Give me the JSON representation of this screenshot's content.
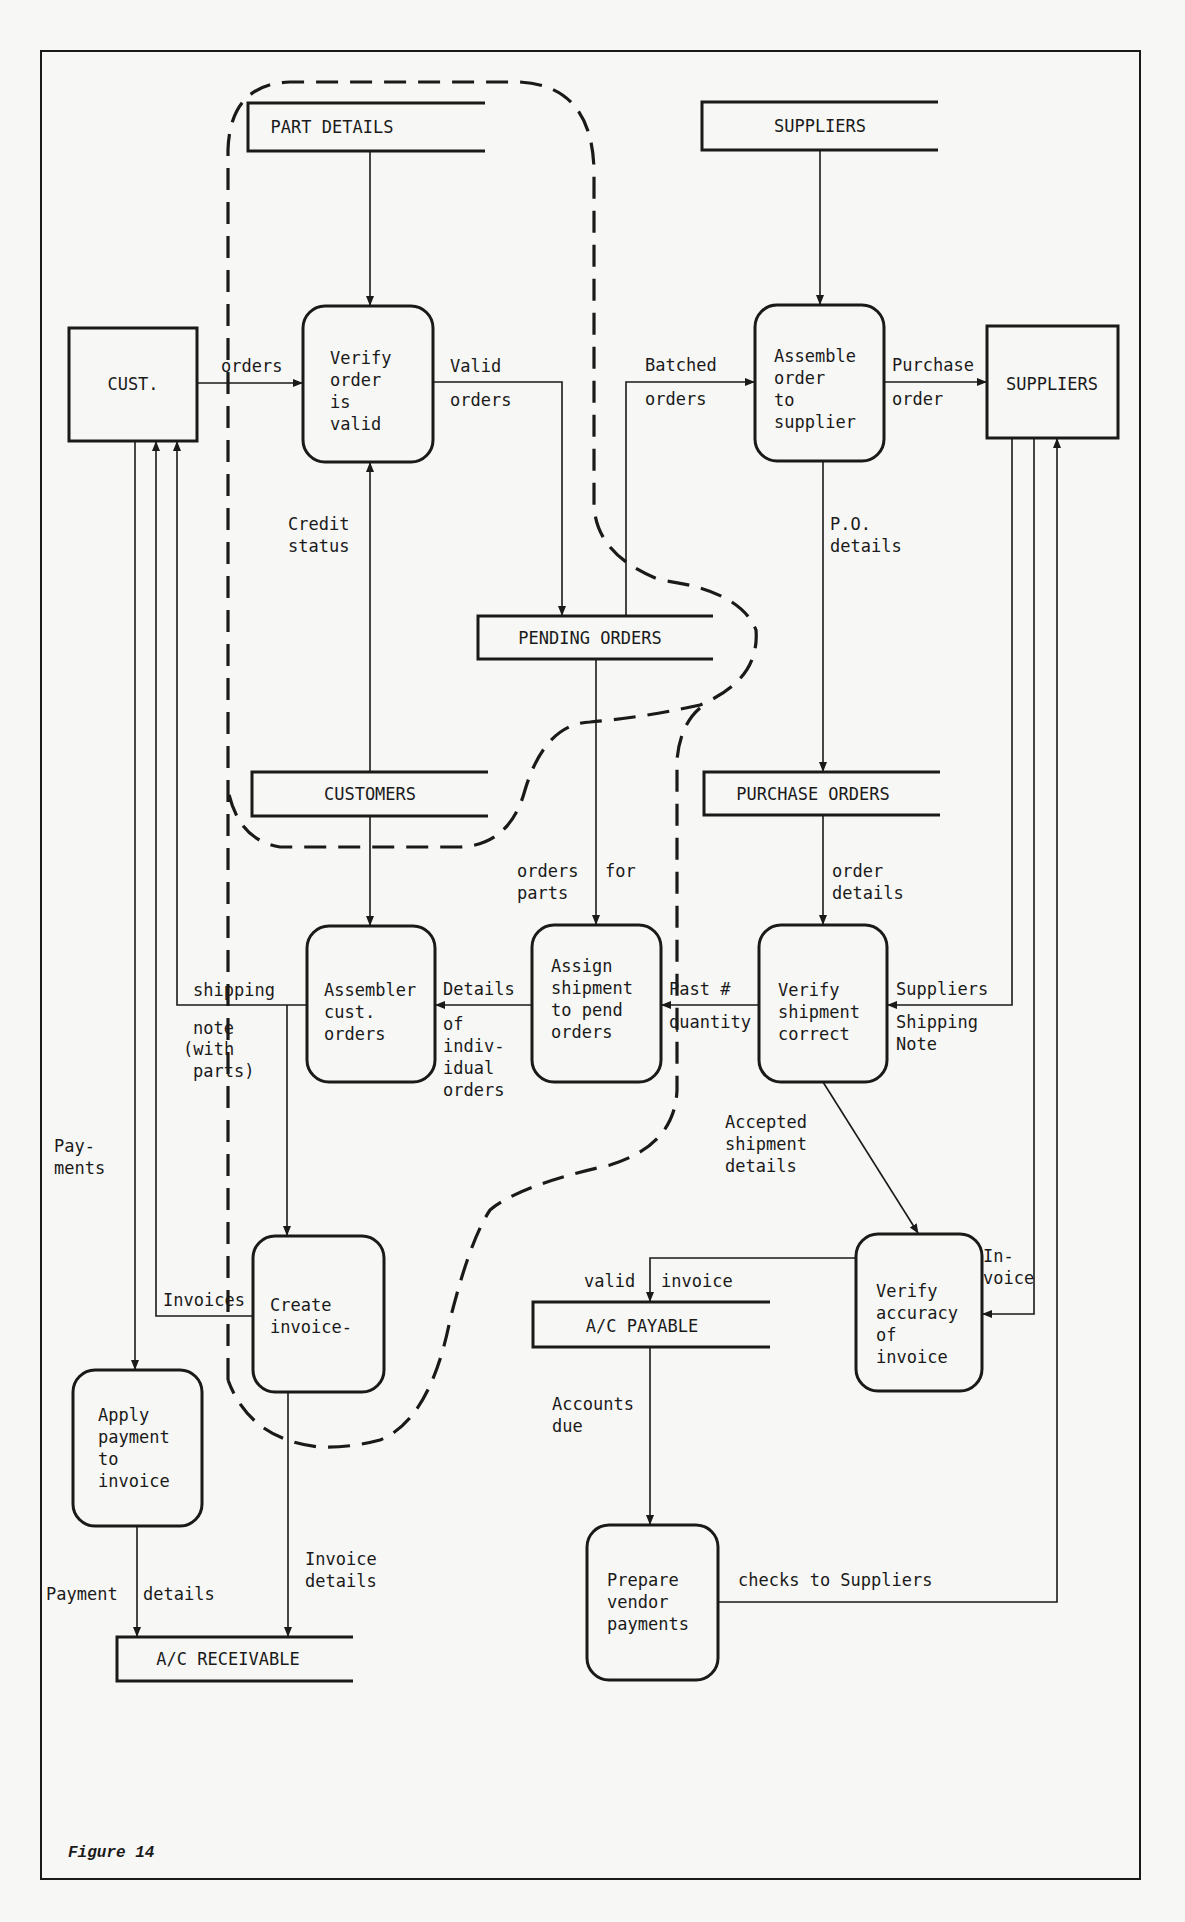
{
  "figure": {
    "caption": "Figure 14"
  },
  "external_entities": {
    "customer": "CUST.",
    "suppliers": "SUPPLIERS"
  },
  "data_stores": {
    "part_details": "PART DETAILS",
    "suppliers": "SUPPLIERS",
    "pending_orders": "PENDING ORDERS",
    "customers": "CUSTOMERS",
    "purchase_orders": "PURCHASE ORDERS",
    "ac_payable": "A/C PAYABLE",
    "ac_receivable": "A/C RECEIVABLE"
  },
  "processes": {
    "verify_order": [
      "Verify",
      "order",
      "is",
      "valid"
    ],
    "assemble_order": [
      "Assemble",
      "order",
      "to",
      "supplier"
    ],
    "assembler_cust": [
      "Assembler",
      "cust.",
      "orders"
    ],
    "assign_shipment": [
      "Assign",
      "shipment",
      "to pend",
      "orders"
    ],
    "verify_shipment": [
      "Verify",
      "shipment",
      "correct"
    ],
    "create_invoice": [
      "Create",
      "invoice-"
    ],
    "verify_accuracy": [
      "Verify",
      "accuracy",
      "of",
      "invoice"
    ],
    "apply_payment": [
      "Apply",
      "payment",
      "to",
      "invoice"
    ],
    "prepare_vendor": [
      "Prepare",
      "vendor",
      "payments"
    ]
  },
  "flows": {
    "orders": "orders",
    "valid_orders_1": "Valid",
    "valid_orders_2": "orders",
    "batched_1": "Batched",
    "batched_2": "orders",
    "purchase_1": "Purchase",
    "purchase_2": "order",
    "credit_1": "Credit",
    "credit_2": "status",
    "po_1": "P.O.",
    "po_2": "details",
    "orders_for_1": "orders",
    "orders_for_2": "for",
    "orders_for_3": "parts",
    "order_details_1": "order",
    "order_details_2": "details",
    "shipping_1": "shipping",
    "shipping_2": "note",
    "shipping_3": "(with",
    "shipping_4": "parts)",
    "details_1": "Details",
    "details_2": "of",
    "details_3": "indiv-",
    "details_4": "idual",
    "details_5": "orders",
    "past_1": "Past #",
    "past_2": "quantity",
    "sup_ship_1": "Suppliers",
    "sup_ship_2": "Shipping",
    "sup_ship_3": "Note",
    "accepted_1": "Accepted",
    "accepted_2": "shipment",
    "accepted_3": "details",
    "payments_1": "Pay-",
    "payments_2": "ments",
    "invoices": "Invoices",
    "valid_invoice_1": "valid",
    "valid_invoice_2": "invoice",
    "invoice_1": "In-",
    "invoice_2": "voice",
    "accounts_due_1": "Accounts",
    "accounts_due_2": "due",
    "payment_details_1": "Payment",
    "payment_details_2": "details",
    "invoice_details_1": "Invoice",
    "invoice_details_2": "details",
    "checks": "checks to Suppliers"
  }
}
